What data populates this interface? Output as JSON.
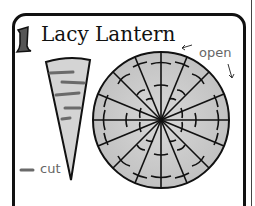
{
  "step": {
    "number": "1"
  },
  "title": "Lacy Lantern",
  "labels": {
    "open": "open",
    "cut": "cut"
  },
  "colors": {
    "outline": "#111111",
    "fill": "#c8c8c8",
    "cut_mark": "#6a6a6a",
    "label_text": "#666666"
  },
  "diagram": {
    "cone": {
      "description": "folded paper cone with cut marks"
    },
    "circle": {
      "description": "unfolded circle with 16 radial folds and arc cuts",
      "segments": 16
    }
  }
}
